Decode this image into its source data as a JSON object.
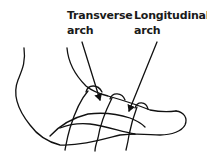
{
  "diagram": {
    "labels": [
      {
        "id": "transverse",
        "line1": "Transverse",
        "line2": "arch"
      },
      {
        "id": "longitudinal",
        "line1": "Longitudinal",
        "line2": "arch"
      }
    ],
    "colors": {
      "line": "#111111",
      "text": "#1a1a1a",
      "background": "#ffffff"
    }
  }
}
